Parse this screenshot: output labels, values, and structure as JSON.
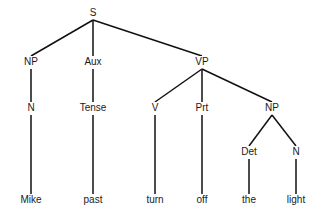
{
  "diagram": {
    "type": "syntax-tree",
    "nodes": [
      {
        "id": "S",
        "label": "S",
        "x": 93,
        "y": 13
      },
      {
        "id": "NP1",
        "label": "NP",
        "x": 31,
        "y": 62
      },
      {
        "id": "Aux",
        "label": "Aux",
        "x": 93,
        "y": 62
      },
      {
        "id": "VP",
        "label": "VP",
        "x": 202,
        "y": 62
      },
      {
        "id": "N1",
        "label": "N",
        "x": 31,
        "y": 108
      },
      {
        "id": "Tense",
        "label": "Tense",
        "x": 93,
        "y": 108
      },
      {
        "id": "V",
        "label": "V",
        "x": 155,
        "y": 108
      },
      {
        "id": "Prt",
        "label": "Prt",
        "x": 202,
        "y": 108
      },
      {
        "id": "NP2",
        "label": "NP",
        "x": 272,
        "y": 108
      },
      {
        "id": "Det",
        "label": "Det",
        "x": 249,
        "y": 152
      },
      {
        "id": "N2",
        "label": "N",
        "x": 296,
        "y": 152
      },
      {
        "id": "Mike",
        "label": "Mike",
        "x": 31,
        "y": 200
      },
      {
        "id": "past",
        "label": "past",
        "x": 93,
        "y": 200
      },
      {
        "id": "turn",
        "label": "turn",
        "x": 155,
        "y": 200
      },
      {
        "id": "off",
        "label": "off",
        "x": 202,
        "y": 200
      },
      {
        "id": "the",
        "label": "the",
        "x": 249,
        "y": 200
      },
      {
        "id": "light",
        "label": "light",
        "x": 296,
        "y": 200
      }
    ],
    "edges": [
      [
        "S",
        "NP1"
      ],
      [
        "S",
        "Aux"
      ],
      [
        "S",
        "VP"
      ],
      [
        "NP1",
        "N1"
      ],
      [
        "Aux",
        "Tense"
      ],
      [
        "VP",
        "V"
      ],
      [
        "VP",
        "Prt"
      ],
      [
        "VP",
        "NP2"
      ],
      [
        "NP2",
        "Det"
      ],
      [
        "NP2",
        "N2"
      ],
      [
        "N1",
        "Mike"
      ],
      [
        "Tense",
        "past"
      ],
      [
        "V",
        "turn"
      ],
      [
        "Prt",
        "off"
      ],
      [
        "Det",
        "the"
      ],
      [
        "N2",
        "light"
      ]
    ]
  }
}
